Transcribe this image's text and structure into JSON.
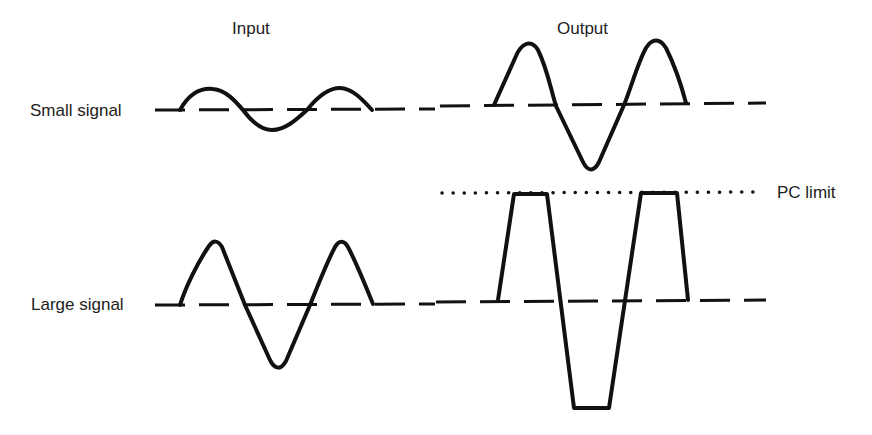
{
  "diagram": {
    "column_headers": {
      "input": "Input",
      "output": "Output"
    },
    "rows": [
      {
        "label": "Small signal",
        "input_wave": "small sine",
        "output_wave": "amplified sine (not clipped)"
      },
      {
        "label": "Large signal",
        "input_wave": "large sine",
        "output_wave": "clipped at PC limit (trapezoidal)"
      }
    ],
    "limit_line": {
      "label": "PC limit",
      "style": "dotted"
    },
    "colors": {
      "stroke": "#111111",
      "text": "#222222",
      "background": "#ffffff"
    }
  }
}
